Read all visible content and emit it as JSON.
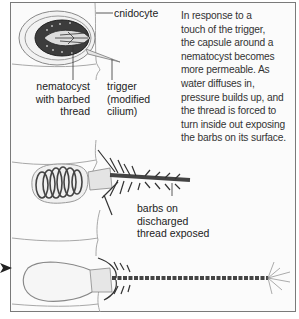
{
  "labels": {
    "cnidocyte": "cnidocyte",
    "nematocyst": [
      "nematocyst",
      "with barbed",
      "thread"
    ],
    "trigger": [
      "trigger",
      "(modified",
      "cilium)"
    ],
    "barbs": [
      "barbs on",
      "discharged",
      "thread exposed"
    ]
  },
  "description": [
    "In response to a",
    "touch of the trigger,",
    "the capsule around a",
    "nematocyst becomes",
    "more permeable. As",
    "water diffuses in,",
    "pressure builds up, and",
    "the thread is forced to",
    "turn inside out exposing",
    "the barbs on its surface."
  ],
  "colors": {
    "ink": "#333333",
    "frame": "#7a7a7a",
    "cell_line": "#9a9a9a",
    "capsule_dark": "#3a3a3a"
  },
  "stages": [
    "nematocyst-coiled",
    "nematocyst-discharging",
    "nematocyst-discharged"
  ],
  "icons": {
    "pointer": "arrowhead-right-icon"
  }
}
